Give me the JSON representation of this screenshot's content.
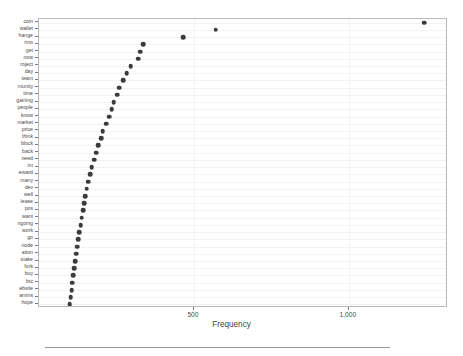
{
  "chart_data": {
    "type": "scatter",
    "title": "",
    "subtitle": "",
    "xlabel": "Frequency",
    "ylabel": "",
    "xlim": [
      0,
      1320
    ],
    "xticks": [
      500,
      1000
    ],
    "xtick_labels": [
      "500",
      "1,000"
    ],
    "grid": true,
    "legend_position": "none",
    "orientation": "horizontal",
    "marker_color": "#3b3b3b",
    "categories": [
      "coin",
      "wallet",
      "hange",
      "rino",
      "get",
      "now",
      "roject",
      "day",
      "team",
      "munity",
      "time",
      "gaining",
      "people",
      "know",
      "market",
      "price",
      "think",
      "block",
      "back",
      "need",
      "im",
      "eward",
      "many",
      "dev",
      "well",
      "lease",
      "pos",
      "want",
      "ngoing",
      "work",
      "go",
      "node",
      "ation",
      "stake",
      "fork",
      "buy",
      "btc",
      "ebsite",
      "amins",
      "hope"
    ],
    "values": [
      1244,
      570,
      465,
      337,
      327,
      320,
      296,
      283,
      272,
      259,
      252,
      241,
      235,
      226,
      216,
      206,
      200,
      192,
      184,
      178,
      170,
      165,
      159,
      154,
      150,
      146,
      142,
      138,
      134,
      130,
      127,
      124,
      120,
      117,
      114,
      111,
      108,
      105,
      102,
      99
    ],
    "axis_line_color": "#b9b9b9",
    "grid_color": "#f2f2f2"
  },
  "figure": {
    "x_axis_title": "Frequency",
    "footer_rule": true
  }
}
